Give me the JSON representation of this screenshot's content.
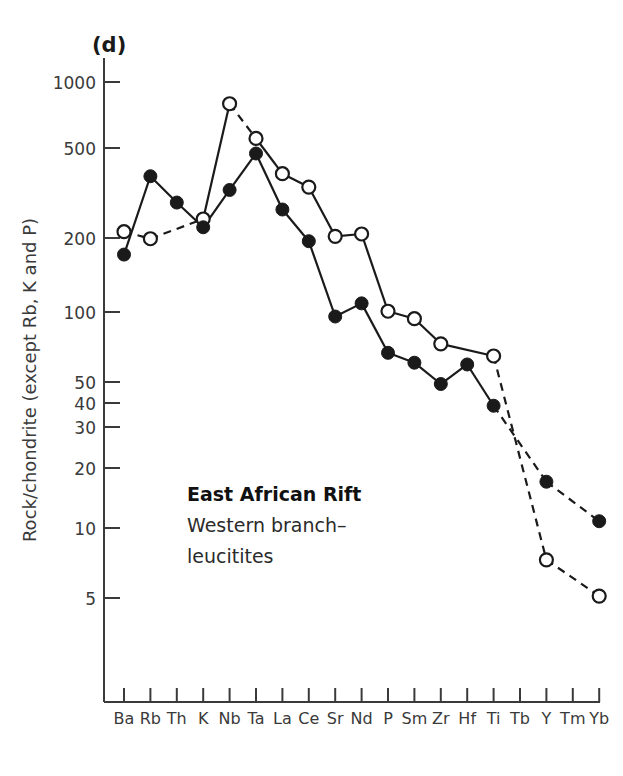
{
  "panel": {
    "label": "(d)"
  },
  "annotation": {
    "line1": "East African Rift",
    "line2": "Western branch–",
    "line3": "leucitites"
  },
  "axes": {
    "ylabel": "Rock/chondrite (except Rb, K and P)",
    "ytick_labels": [
      "1000",
      "500",
      "200",
      "100",
      "50",
      "40",
      "30",
      "20",
      "10",
      "5"
    ],
    "xlabel": ""
  },
  "colors": {
    "line": "#1a1a1a",
    "axis": "#3a3a3a",
    "marker_fill": "#1a1a1a",
    "marker_open": "#ffffff",
    "background": "#ffffff",
    "text": "#2b2b2b"
  },
  "chart_data": {
    "type": "line",
    "title": "",
    "subtitle": "East African Rift Western branch–leucitites",
    "xlabel": "",
    "ylabel": "Rock/chondrite (except Rb, K and P)",
    "yscale": "log",
    "ylim": [
      3.2,
      1400
    ],
    "grid": false,
    "legend": "none",
    "categories": [
      "Ba",
      "Rb",
      "Th",
      "K",
      "Nb",
      "Ta",
      "La",
      "Ce",
      "Sr",
      "Nd",
      "P",
      "Sm",
      "Zr",
      "Hf",
      "Ti",
      "Tb",
      "Y",
      "Tm",
      "Yb"
    ],
    "yticks": [
      1000,
      500,
      200,
      100,
      50,
      40,
      30,
      20,
      10,
      5
    ],
    "ytick_labels": [
      "1000",
      "500",
      "200",
      "100",
      "50",
      "40",
      "30",
      "20",
      "10",
      "5"
    ],
    "series": [
      {
        "name": "open-circle-series",
        "marker": "open-circle",
        "linestyle_by_segment": [
          "dashed",
          "dashed",
          "dashed",
          "solid",
          "dashed",
          "solid",
          "solid",
          "solid",
          "solid",
          "solid",
          "solid",
          "solid",
          "solid",
          "dashed",
          "dashed",
          null,
          "dashed",
          null
        ],
        "values": [
          215,
          200,
          null,
          245,
          800,
          560,
          390,
          340,
          205,
          210,
          95,
          88,
          68,
          null,
          60,
          null,
          7.4,
          null,
          5.1
        ]
      },
      {
        "name": "filled-circle-series",
        "marker": "filled-circle",
        "linestyle_by_segment": [
          "solid",
          "solid",
          "solid",
          "solid",
          "solid",
          "solid",
          "solid",
          "solid",
          "solid",
          "solid",
          "solid",
          "solid",
          "solid",
          "solid",
          "dashed",
          null,
          "dashed",
          null
        ],
        "values": [
          170,
          380,
          290,
          225,
          330,
          480,
          270,
          195,
          90,
          103,
          62,
          56,
          45,
          55,
          36,
          null,
          16.5,
          null,
          11
        ]
      }
    ]
  }
}
